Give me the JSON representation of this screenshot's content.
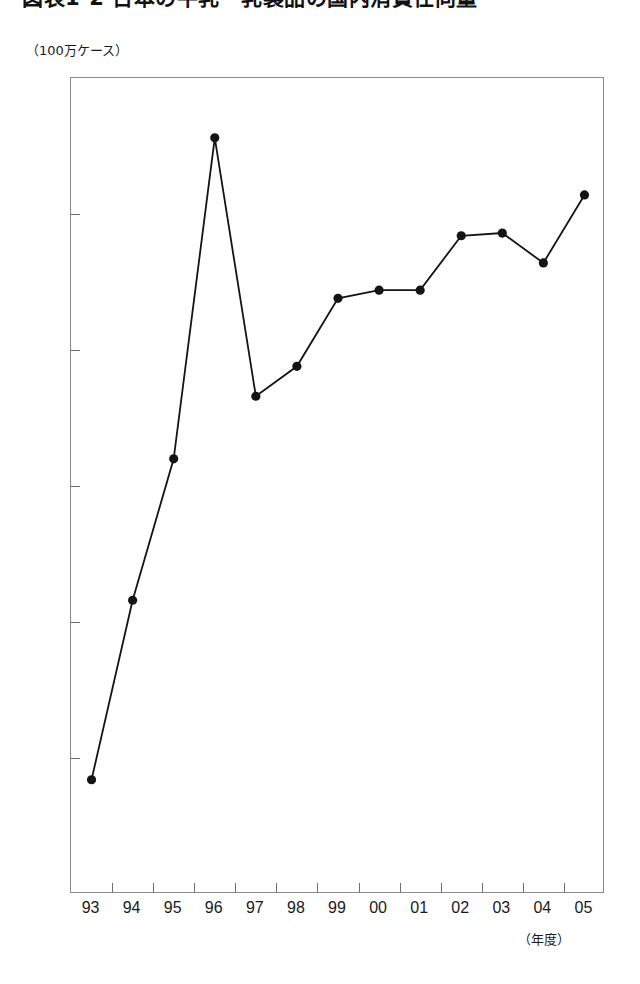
{
  "title": {
    "text": "図表1-2 日本の牛乳・乳製品の国内消費仕向量",
    "note": "clipped"
  },
  "axis": {
    "y_unit_label": "（100万ケース）",
    "x_caption": "（年度）"
  },
  "chart_data": {
    "type": "line",
    "title": "図表1-2 日本の牛乳・乳製品の国内消費仕向量",
    "xlabel": "（年度）",
    "ylabel": "（100万ケース）",
    "categories": [
      "93",
      "94",
      "95",
      "96",
      "97",
      "98",
      "99",
      "00",
      "01",
      "02",
      "03",
      "04",
      "05"
    ],
    "values": [
      2.92,
      3.58,
      4.1,
      5.28,
      4.33,
      4.44,
      4.69,
      4.72,
      4.72,
      4.92,
      4.93,
      4.82,
      5.07
    ],
    "ylim": [
      2.5,
      5.5
    ],
    "ytick_labels": [
      "5.5",
      "5.0",
      "4.5",
      "4.0",
      "3.5",
      "3.0",
      "2.5"
    ],
    "ytick_values": [
      5.5,
      5.0,
      4.5,
      4.0,
      3.5,
      3.0,
      2.5
    ],
    "ytick_step": 0.5,
    "grid": false,
    "legend": "none",
    "marker": "filled-circle",
    "line_color": "#141414",
    "marker_color": "#141414",
    "frame_color": "#8a8a8a"
  }
}
